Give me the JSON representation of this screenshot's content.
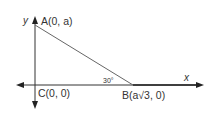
{
  "diagram": {
    "type": "coordinate-triangle",
    "axes": {
      "x_label": "x",
      "y_label": "y"
    },
    "points": {
      "A": {
        "label": "A(0, a)",
        "x": 0,
        "y": "a"
      },
      "B": {
        "label_prefix": "B(a",
        "label_radical": "√3",
        "label_suffix": ", 0)",
        "x": "a√3",
        "y": 0
      },
      "C": {
        "label": "C(0, 0)",
        "x": 0,
        "y": 0
      }
    },
    "angle": {
      "label": "30°",
      "vertex": "B"
    },
    "colors": {
      "axis": "#222222",
      "triangle": "#666666",
      "text": "#333333"
    }
  }
}
